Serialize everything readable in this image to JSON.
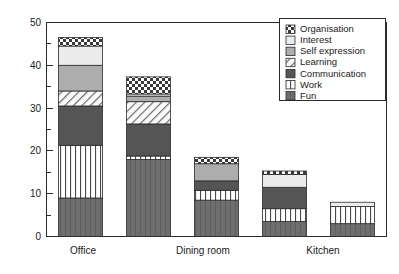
{
  "chart_data": {
    "type": "bar",
    "subtype": "stacked-bar",
    "title": "",
    "xlabel": "",
    "ylabel": "",
    "ylim": [
      0,
      50
    ],
    "y_ticks_major": [
      0,
      10,
      20,
      30,
      40,
      50
    ],
    "y_ticks_minor": [
      5,
      15,
      25,
      35,
      45
    ],
    "grid": false,
    "legend_position": "top-right",
    "categories": [
      "Office",
      "",
      "Dining room",
      "",
      "Kitchen"
    ],
    "tick_labels_x": [
      "Office",
      "Dining room",
      "Kitchen"
    ],
    "series": [
      {
        "name": "Fun",
        "values": [
          9.0,
          18.0,
          8.5,
          3.5,
          3.0
        ]
      },
      {
        "name": "Work",
        "values": [
          12.3,
          0.8,
          2.3,
          3.0,
          4.0
        ]
      },
      {
        "name": "Communication",
        "values": [
          9.2,
          7.5,
          2.2,
          5.0,
          0.0
        ]
      },
      {
        "name": "Learning",
        "values": [
          3.5,
          5.2,
          0.0,
          0.0,
          0.0
        ]
      },
      {
        "name": "Self expression",
        "values": [
          6.0,
          1.3,
          4.0,
          0.0,
          0.0
        ]
      },
      {
        "name": "Interest",
        "values": [
          4.5,
          0.5,
          0.0,
          3.0,
          1.0
        ]
      },
      {
        "name": "Organisation",
        "values": [
          2.0,
          4.0,
          1.5,
          0.8,
          0.0
        ]
      }
    ],
    "totals": [
      46.5,
      37.3,
      18.5,
      15.3,
      8.0
    ],
    "legend_entries": [
      {
        "label": "Organisation",
        "pattern": "checkerboard",
        "color": "#8f8f8f"
      },
      {
        "label": "Interest",
        "pattern": "solid-light",
        "color": "#ececec"
      },
      {
        "label": "Self expression",
        "pattern": "solid-gray",
        "color": "#adadad"
      },
      {
        "label": "Learning",
        "pattern": "diagonal",
        "color": "#f2f2f2"
      },
      {
        "label": "Communication",
        "pattern": "solid-dark",
        "color": "#555555"
      },
      {
        "label": "Work",
        "pattern": "vertical",
        "color": "#fbfbfb"
      },
      {
        "label": "Fun",
        "pattern": "solid-darker",
        "color": "#6e6e6e"
      }
    ]
  },
  "axis": {
    "y_label_0": "0",
    "y_label_10": "10",
    "y_label_20": "20",
    "y_label_30": "30",
    "y_label_40": "40",
    "y_label_50": "50"
  },
  "legend": {
    "item_0": "Organisation",
    "item_1": "Interest",
    "item_2": "Self expression",
    "item_3": "Learning",
    "item_4": "Communication",
    "item_5": "Work",
    "item_6": "Fun"
  },
  "xaxis": {
    "cat_0": "Office",
    "cat_1": "Dining room",
    "cat_2": "Kitchen"
  }
}
